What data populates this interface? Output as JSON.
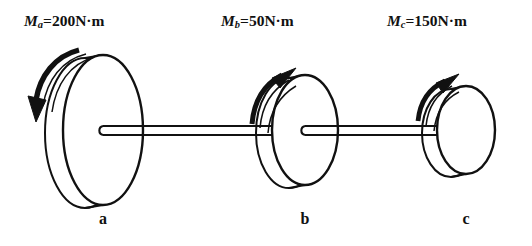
{
  "figure": {
    "background_color": "#ffffff",
    "stroke_color": "#111111",
    "moment_labels": [
      {
        "symbol": "M",
        "subscript": "a",
        "equals": "=",
        "value": "200N·m",
        "full": "Mₐ=200N·m"
      },
      {
        "symbol": "M",
        "subscript": "b",
        "equals": "=",
        "value": "50N·m",
        "full": "Mᵇ=50N·m"
      },
      {
        "symbol": "M",
        "subscript": "c",
        "equals": "=",
        "value": "150N·m",
        "full": "Mᶜ=150N·m"
      }
    ],
    "station_letters": [
      "a",
      "b",
      "c"
    ],
    "disks": [
      {
        "name": "disk-a",
        "center_x": 103,
        "center_y": 130,
        "rx": 40,
        "ry": 75,
        "rim_dx": -18,
        "rim_dy": 3,
        "arrow_direction": "counterclockwise-down-left"
      },
      {
        "name": "disk-b",
        "center_x": 305,
        "center_y": 130,
        "rx": 33,
        "ry": 55,
        "rim_dx": -16,
        "rim_dy": 3,
        "arrow_direction": "clockwise-up-right"
      },
      {
        "name": "disk-c",
        "center_x": 466,
        "center_y": 130,
        "rx": 29,
        "ry": 44,
        "rim_dx": -15,
        "rim_dy": 3,
        "arrow_direction": "clockwise-up-right"
      }
    ],
    "shaft": {
      "y_top": 126,
      "y_bottom": 135,
      "left_end": 95,
      "right_end": 458
    }
  }
}
